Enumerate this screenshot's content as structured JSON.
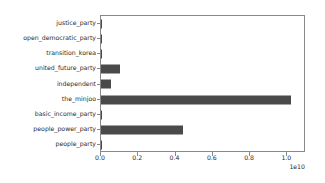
{
  "chart_data": {
    "type": "bar",
    "orientation": "horizontal",
    "title": "",
    "xlabel": "",
    "ylabel": "",
    "categories": [
      "justice_party",
      "open_democratic_party",
      "transition_korea",
      "united_future_party",
      "independent",
      "the_minjoo",
      "basic_income_party",
      "people_power_party",
      "people_party"
    ],
    "values": [
      40000000,
      0,
      0,
      1000000000,
      550000000,
      10200000000,
      0,
      4400000000,
      60000000
    ],
    "xlim": [
      0,
      11000000000
    ],
    "ylim_categories": 9,
    "x_tick_labels": [
      "0.0",
      "0.2",
      "0.4",
      "0.6",
      "0.8",
      "1.0"
    ],
    "x_tick_values": [
      0,
      2000000000,
      4000000000,
      6000000000,
      8000000000,
      10000000000
    ],
    "x_offset_text": "1e10",
    "grid": false,
    "legend": null,
    "bar_color": "#4a4a4a",
    "axes_color": "#888888",
    "background_color": "#ffffff"
  }
}
